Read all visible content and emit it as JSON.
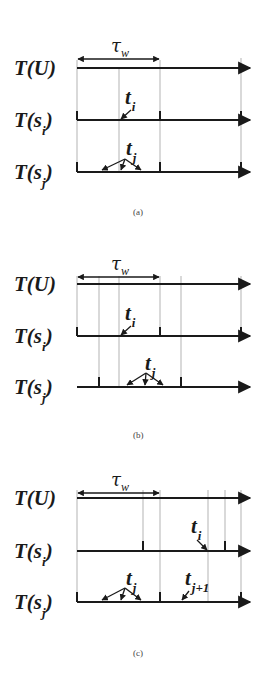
{
  "figure": {
    "panels": [
      {
        "id": "a",
        "caption": "(a)",
        "tau_label": "τ",
        "tau_sub": "w",
        "rows": [
          {
            "label": "T(U)",
            "main": "T(U)",
            "sub": ""
          },
          {
            "label": "T(s_i)",
            "main": "T(s",
            "sub": "i",
            "close": ")"
          },
          {
            "label": "T(s_j)",
            "main": "T(s",
            "sub": "j",
            "close": ")"
          }
        ],
        "annotations": [
          {
            "main": "t",
            "sub": "i"
          },
          {
            "main": "t",
            "sub": "j"
          }
        ],
        "vertical_lines_x": [
          77,
          119,
          160,
          241
        ],
        "si_ticks_x": [
          77,
          160,
          241
        ],
        "sj_ticks_x": [
          77,
          160,
          241
        ]
      },
      {
        "id": "b",
        "caption": "(b)",
        "tau_label": "τ",
        "tau_sub": "w",
        "rows": [
          {
            "label": "T(U)",
            "main": "T(U)",
            "sub": ""
          },
          {
            "label": "T(s_i)",
            "main": "T(s",
            "sub": "i",
            "close": ")"
          },
          {
            "label": "T(s_j)",
            "main": "T(s",
            "sub": "j",
            "close": ")"
          }
        ],
        "annotations": [
          {
            "main": "t",
            "sub": "i"
          },
          {
            "main": "t",
            "sub": "j"
          }
        ],
        "vertical_lines_x": [
          77,
          99,
          119,
          160,
          181,
          241
        ],
        "si_ticks_x": [
          77,
          160,
          241
        ],
        "sj_ticks_x": [
          99,
          181
        ]
      },
      {
        "id": "c",
        "caption": "(c)",
        "tau_label": "τ",
        "tau_sub": "w",
        "rows": [
          {
            "label": "T(U)",
            "main": "T(U)",
            "sub": ""
          },
          {
            "label": "T(s_i)",
            "main": "T(s",
            "sub": "i",
            "close": ")"
          },
          {
            "label": "T(s_j)",
            "main": "T(s",
            "sub": "j",
            "close": ")"
          }
        ],
        "annotations": [
          {
            "main": "t",
            "sub": "i"
          },
          {
            "main": "t",
            "sub": "j"
          },
          {
            "main": "t",
            "sub": "j+1"
          }
        ],
        "vertical_lines_x": [
          77,
          143,
          160,
          208,
          225,
          241
        ],
        "si_ticks_x": [
          143,
          225
        ],
        "sj_ticks_x": [
          77,
          160,
          241
        ]
      }
    ]
  }
}
